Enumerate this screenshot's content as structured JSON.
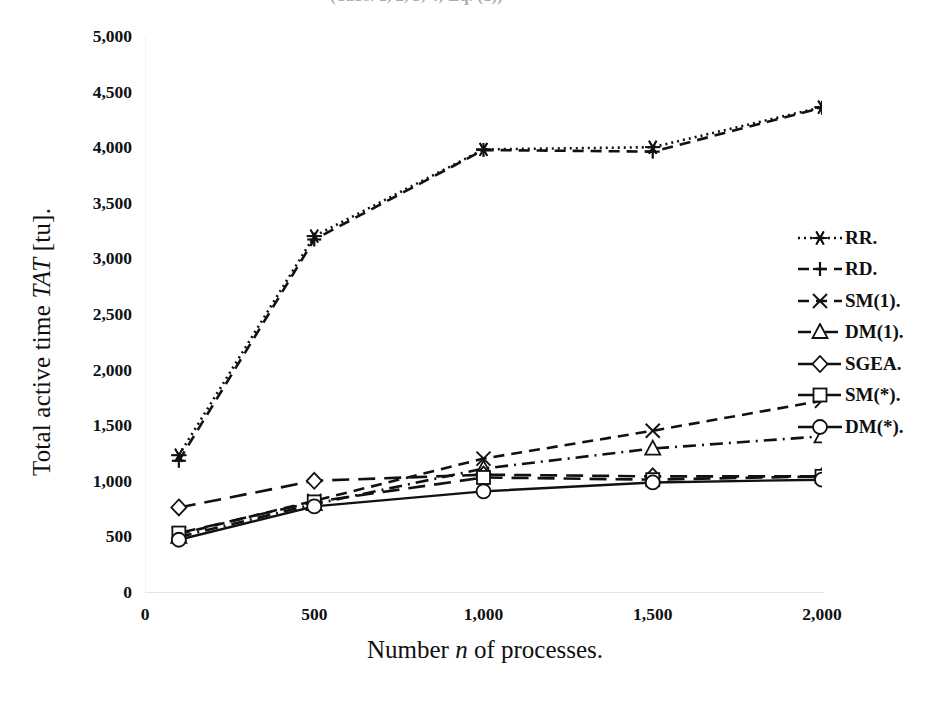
{
  "title_sliver": "(Tabs. 1, 2, 3, 4; Eq. (1))",
  "axes": {
    "ylabel_pre": "Total active time ",
    "ylabel_italic": "TAT",
    "ylabel_post": " [tu].",
    "xlabel_pre": "Number ",
    "xlabel_italic": "n",
    "xlabel_post": " of processes.",
    "yticks": [
      "5,000",
      "4,500",
      "4,000",
      "3,500",
      "3,000",
      "2,500",
      "2,000",
      "1,500",
      "1,000",
      "500",
      "0"
    ],
    "xticks": [
      "0",
      "500",
      "1,000",
      "1,500",
      "2,000"
    ]
  },
  "legend": {
    "items": [
      {
        "label": "RR.",
        "key": "dotted-asterisk-key"
      },
      {
        "label": "RD.",
        "key": "dashed-plus-key"
      },
      {
        "label": "SM(1).",
        "key": "dashed-cross-key"
      },
      {
        "label": "DM(1).",
        "key": "dashdot-triangle-key"
      },
      {
        "label": "SGEA.",
        "key": "longdash-diamond-key"
      },
      {
        "label": "SM(*).",
        "key": "longdash-square-key"
      },
      {
        "label": "DM(*).",
        "key": "solid-circle-key"
      }
    ]
  },
  "chart_data": {
    "type": "line",
    "title": "",
    "xlabel": "Number n of processes.",
    "ylabel": "Total active time TAT [tu].",
    "x": [
      100,
      500,
      1000,
      1500,
      2000
    ],
    "xlim": [
      0,
      2000
    ],
    "ylim": [
      0,
      5000
    ],
    "ytick_step": 500,
    "grid": false,
    "legend_position": "right",
    "series": [
      {
        "name": "RR.",
        "marker": "asterisk",
        "linestyle": "dotted",
        "values": [
          1230,
          3200,
          3980,
          4000,
          4360
        ]
      },
      {
        "name": "RD.",
        "marker": "plus",
        "linestyle": "dashed",
        "values": [
          1180,
          3170,
          3975,
          3960,
          4355
        ]
      },
      {
        "name": "SM(1).",
        "marker": "cross",
        "linestyle": "dashed",
        "values": [
          520,
          820,
          1200,
          1450,
          1720
        ]
      },
      {
        "name": "DM(1).",
        "marker": "triangle",
        "linestyle": "dashdot",
        "values": [
          495,
          790,
          1110,
          1290,
          1400
        ]
      },
      {
        "name": "SGEA.",
        "marker": "diamond",
        "linestyle": "longdash",
        "values": [
          760,
          1000,
          1055,
          1040,
          1040
        ]
      },
      {
        "name": "SM(*).",
        "marker": "square",
        "linestyle": "longdash",
        "values": [
          530,
          810,
          1030,
          1010,
          1040
        ]
      },
      {
        "name": "DM(*).",
        "marker": "circle",
        "linestyle": "solid",
        "values": [
          470,
          770,
          905,
          985,
          1010
        ]
      }
    ]
  }
}
